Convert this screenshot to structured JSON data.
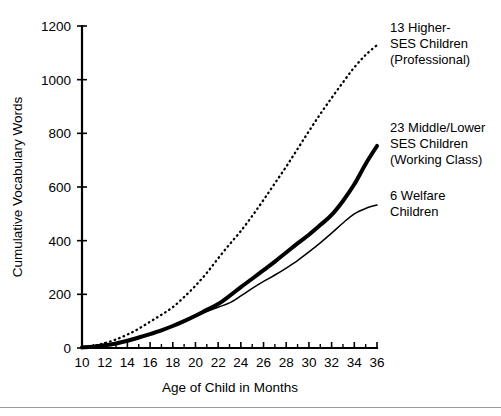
{
  "chart_data": {
    "type": "line",
    "title": "",
    "xlabel": "Age of Child in Months",
    "ylabel": "Cumulative Vocabulary Words",
    "xlim": [
      10,
      36
    ],
    "ylim": [
      0,
      1200
    ],
    "grid": false,
    "legend_position": "right-of-curves",
    "x_tick_labels": [
      "10",
      "12",
      "14",
      "16",
      "18",
      "20",
      "22",
      "24",
      "26",
      "28",
      "30",
      "32",
      "34",
      "36"
    ],
    "x_tick_values": [
      10,
      12,
      14,
      16,
      18,
      20,
      22,
      24,
      26,
      28,
      30,
      32,
      34,
      36
    ],
    "x_minor_tick_values": [
      11,
      13,
      15,
      17,
      19,
      21,
      23,
      25,
      27,
      29,
      31,
      33,
      35
    ],
    "y_tick_labels": [
      "0",
      "200",
      "400",
      "600",
      "800",
      "1000",
      "1200"
    ],
    "y_tick_values": [
      0,
      200,
      400,
      600,
      800,
      1000,
      1200
    ],
    "x": [
      10,
      11,
      12,
      13,
      14,
      15,
      16,
      17,
      18,
      19,
      20,
      21,
      22,
      23,
      24,
      25,
      26,
      27,
      28,
      29,
      30,
      31,
      32,
      33,
      34,
      35,
      36
    ],
    "series": [
      {
        "name": "13 Higher-SES Children (Professional)",
        "style": "dotted",
        "label_lines": [
          "13 Higher-",
          "SES Children",
          "(Professional)"
        ],
        "values": [
          2,
          8,
          18,
          32,
          50,
          72,
          98,
          124,
          152,
          190,
          232,
          280,
          334,
          386,
          436,
          492,
          552,
          614,
          676,
          742,
          808,
          872,
          932,
          990,
          1046,
          1092,
          1129
        ]
      },
      {
        "name": "23 Middle/Lower SES Children (Working Class)",
        "style": "thick-solid",
        "label_lines": [
          "23 Middle/Lower",
          "SES Children",
          "(Working Class)"
        ],
        "values": [
          2,
          5,
          10,
          17,
          27,
          39,
          52,
          66,
          82,
          100,
          120,
          142,
          164,
          194,
          227,
          258,
          290,
          322,
          356,
          390,
          422,
          458,
          496,
          548,
          610,
          686,
          753
        ]
      },
      {
        "name": "6 Welfare Children",
        "style": "thin-solid",
        "label_lines": [
          "6 Welfare",
          "Children"
        ],
        "values": [
          2,
          5,
          10,
          17,
          27,
          39,
          52,
          66,
          82,
          100,
          118,
          136,
          152,
          168,
          194,
          222,
          248,
          272,
          298,
          326,
          358,
          392,
          428,
          466,
          500,
          520,
          533
        ]
      }
    ]
  },
  "axes": {
    "y_title": "Cumulative Vocabulary Words",
    "x_title": "Age of Child in Months"
  },
  "annotations": {
    "professional": {
      "line1": "13 Higher-",
      "line2": "SES Children",
      "line3": "(Professional)"
    },
    "working": {
      "line1": "23 Middle/Lower",
      "line2": "SES Children",
      "line3": "(Working Class)"
    },
    "welfare": {
      "line1": "6 Welfare",
      "line2": "Children"
    }
  },
  "colors": {
    "ink": "#000000",
    "background": "#ffffff",
    "rule": "#9a9a9a"
  }
}
